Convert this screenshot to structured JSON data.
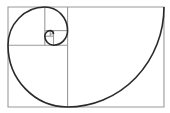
{
  "diagram": {
    "colors": {
      "background": "#ffffff",
      "grid": "#9a9a9a",
      "spiral": "#2a2a2a"
    },
    "squares_count": 8,
    "aspect_ratio": "1:1.618"
  }
}
